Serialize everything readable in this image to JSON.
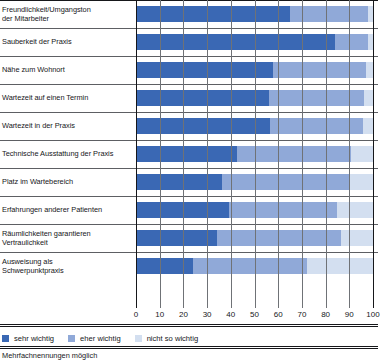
{
  "chart_data": {
    "type": "bar",
    "orientation": "horizontal",
    "stacked": true,
    "title": "",
    "xlabel": "",
    "ylabel": "",
    "xlim": [
      0,
      100
    ],
    "grid": true,
    "legend_position": "bottom-left",
    "categories": [
      "Freundlichkeit/Umgangston der Mitarbeiter",
      "Sauberkeit der Praxis",
      "Nähe zum Wohnort",
      "Wartezeit auf einen Termin",
      "Wartezeit in der Praxis",
      "Technische Ausstattung der Praxis",
      "Platz im Wartebereich",
      "Erfahrungen anderer Patienten",
      "Räumlichkeiten garantieren Vertraulichkeit",
      "Ausweisung als Schwerpunktpraxis"
    ],
    "category_lines": [
      [
        "Freundlichkeit/Umgangston",
        "der Mitarbeiter"
      ],
      [
        "Sauberkeit der Praxis"
      ],
      [
        "Nähe zum Wohnort"
      ],
      [
        "Wartezeit auf einen Termin"
      ],
      [
        "Wartezeit in der Praxis"
      ],
      [
        "Technische Ausstattung der Praxis"
      ],
      [
        "Platz im Wartebereich"
      ],
      [
        "Erfahrungen anderer Patienten"
      ],
      [
        "Räumlichkeiten garantieren",
        "Vertraulichkeit"
      ],
      [
        "Ausweisung als",
        "Schwerpunktpraxis"
      ]
    ],
    "series": [
      {
        "name": "sehr wichtig",
        "color": "#3a68b4",
        "values": [
          65,
          83,
          58,
          56,
          56,
          42,
          36,
          39,
          33,
          24
        ]
      },
      {
        "name": "eher wichtig",
        "color": "#90a9d8",
        "values": [
          33,
          14,
          39,
          40,
          39,
          48,
          53,
          45,
          51,
          48
        ]
      },
      {
        "name": "nicht so wichtig",
        "color": "#d3dff0",
        "values": [
          2,
          2,
          3,
          4,
          4,
          9,
          10,
          15,
          13,
          28
        ]
      }
    ],
    "xticks": [
      0,
      10,
      20,
      30,
      40,
      50,
      60,
      70,
      80,
      90,
      100
    ],
    "xtick_labels": [
      "0",
      "10",
      "20",
      "30",
      "40",
      "50",
      "60",
      "70",
      "80",
      "90",
      "100"
    ]
  },
  "legend": {
    "items": [
      {
        "label": "sehr wichtig",
        "color": "#3a68b4"
      },
      {
        "label": "eher wichtig",
        "color": "#90a9d8"
      },
      {
        "label": "nicht so wichtig",
        "color": "#d3dff0"
      }
    ]
  },
  "footnote": "Mehrfachnennungen möglich"
}
